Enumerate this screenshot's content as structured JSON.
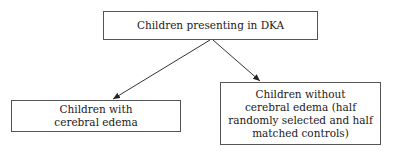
{
  "diagram": {
    "type": "flowchart",
    "nodes": {
      "root": {
        "label": "Children presenting in DKA"
      },
      "left": {
        "label_lines": [
          "Children with",
          "cerebral edema"
        ]
      },
      "right": {
        "label_lines": [
          "Children without",
          "cerebral edema (half",
          "randomly selected and half",
          "matched controls)"
        ]
      }
    },
    "edges": [
      {
        "from": "root",
        "to": "left"
      },
      {
        "from": "root",
        "to": "right"
      }
    ]
  }
}
